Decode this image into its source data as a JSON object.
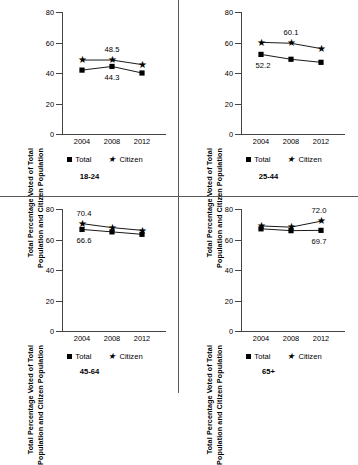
{
  "axis": {
    "y_title_line1": "Total Percentage Voted of Total",
    "y_title_line2": "Population and Citizen Population",
    "y_ticks": [
      "0",
      "20",
      "40",
      "60",
      "80"
    ],
    "x_ticks": [
      "2004",
      "2008",
      "2012"
    ]
  },
  "legend": {
    "total": "Total",
    "citizen": "Citizen"
  },
  "chart_data": [
    {
      "type": "line",
      "title": "18-24",
      "xlabel": "",
      "ylabel": "Total Percentage Voted of Total Population and Citizen Population",
      "x": [
        "2004",
        "2008",
        "2012"
      ],
      "ylim": [
        0,
        80
      ],
      "grid": false,
      "legend_position": "bottom",
      "series": [
        {
          "name": "Total",
          "values": [
            41.9,
            44.3,
            40.0
          ],
          "marker": "square"
        },
        {
          "name": "Citizen",
          "values": [
            48.5,
            48.5,
            45.5
          ],
          "marker": "star"
        }
      ],
      "annotations": [
        {
          "text": "48.5",
          "series": "Citizen",
          "x": "2008"
        },
        {
          "text": "44.3",
          "series": "Total",
          "x": "2008"
        }
      ]
    },
    {
      "type": "line",
      "title": "25-44",
      "xlabel": "",
      "ylabel": "Total Percentage Voted of Total Population and Citizen Population",
      "x": [
        "2004",
        "2008",
        "2012"
      ],
      "ylim": [
        0,
        80
      ],
      "grid": false,
      "legend_position": "bottom",
      "series": [
        {
          "name": "Total",
          "values": [
            52.2,
            49.0,
            47.0
          ],
          "marker": "square"
        },
        {
          "name": "Citizen",
          "values": [
            60.1,
            59.5,
            56.0
          ],
          "marker": "star"
        }
      ],
      "annotations": [
        {
          "text": "60.1",
          "series": "Citizen",
          "x": "2008"
        },
        {
          "text": "52.2",
          "series": "Total",
          "x": "2004"
        }
      ]
    },
    {
      "type": "line",
      "title": "45-64",
      "xlabel": "",
      "ylabel": "Total Percentage Voted of Total Population and Citizen Population",
      "x": [
        "2004",
        "2008",
        "2012"
      ],
      "ylim": [
        0,
        80
      ],
      "grid": false,
      "legend_position": "bottom",
      "series": [
        {
          "name": "Total",
          "values": [
            66.6,
            65.0,
            63.4
          ],
          "marker": "square"
        },
        {
          "name": "Citizen",
          "values": [
            70.4,
            67.8,
            66.0
          ],
          "marker": "star"
        }
      ],
      "annotations": [
        {
          "text": "70.4",
          "series": "Citizen",
          "x": "2004"
        },
        {
          "text": "66.6",
          "series": "Total",
          "x": "2004"
        }
      ]
    },
    {
      "type": "line",
      "title": "65+",
      "xlabel": "",
      "ylabel": "Total Percentage Voted of Total Population and Citizen Population",
      "x": [
        "2004",
        "2008",
        "2012"
      ],
      "ylim": [
        0,
        80
      ],
      "grid": false,
      "legend_position": "bottom",
      "series": [
        {
          "name": "Total",
          "values": [
            67.0,
            65.8,
            66.0
          ],
          "marker": "square"
        },
        {
          "name": "Citizen",
          "values": [
            68.9,
            68.1,
            72.0
          ],
          "marker": "star"
        }
      ],
      "annotations": [
        {
          "text": "72.0",
          "series": "Citizen",
          "x": "2012"
        },
        {
          "text": "69.7",
          "series": "Total",
          "x": "2012"
        }
      ]
    }
  ]
}
